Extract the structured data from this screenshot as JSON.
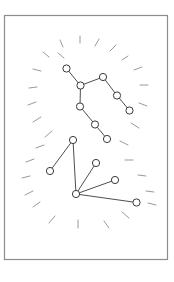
{
  "figure": {
    "canvas": {
      "width": 174,
      "height": 282,
      "background": "#ffffff"
    },
    "frame": {
      "x": 4.5,
      "y": 15.5,
      "width": 163,
      "height": 244,
      "stroke": "#8d8d8d",
      "stroke_width": 1.2,
      "fill": "#ffffff"
    },
    "style": {
      "node_fill": "#ffffff",
      "node_stroke": "#3a3a3a",
      "node_stroke_width": 1.0,
      "node_radius": 3.6,
      "edge_stroke": "#3a3a3a",
      "edge_stroke_width": 0.9,
      "ray_stroke": "#9a9a9a",
      "ray_stroke_width": 1.0
    },
    "constellations": [
      {
        "name": "upper-constellation",
        "label": "big-dipper-like",
        "nodes": [
          {
            "id": "u1",
            "cx": 66.5,
            "cy": 68.5
          },
          {
            "id": "u2",
            "cx": 80.5,
            "cy": 85.5
          },
          {
            "id": "u3",
            "cx": 103.0,
            "cy": 77.0
          },
          {
            "id": "u4",
            "cx": 117.0,
            "cy": 95.5
          },
          {
            "id": "u5",
            "cx": 129.5,
            "cy": 110.5
          },
          {
            "id": "u6",
            "cx": 80.0,
            "cy": 106.5
          },
          {
            "id": "u7",
            "cx": 95.0,
            "cy": 124.5
          },
          {
            "id": "u8",
            "cx": 107.0,
            "cy": 139.0
          }
        ],
        "edges": [
          [
            "u1",
            "u2"
          ],
          [
            "u2",
            "u3"
          ],
          [
            "u3",
            "u4"
          ],
          [
            "u4",
            "u5"
          ],
          [
            "u2",
            "u6"
          ],
          [
            "u6",
            "u7"
          ],
          [
            "u7",
            "u8"
          ]
        ]
      },
      {
        "name": "lower-constellation",
        "label": "fan-hub-like",
        "nodes": [
          {
            "id": "l1",
            "cx": 73.0,
            "cy": 140.0
          },
          {
            "id": "l2",
            "cx": 50.0,
            "cy": 171.0
          },
          {
            "id": "l3",
            "cx": 96.0,
            "cy": 163.0
          },
          {
            "id": "l4",
            "cx": 115.0,
            "cy": 180.0
          },
          {
            "id": "l5",
            "cx": 76.0,
            "cy": 194.0
          },
          {
            "id": "l6",
            "cx": 136.5,
            "cy": 202.5
          }
        ],
        "edges": [
          [
            "l1",
            "l2"
          ],
          [
            "l1",
            "l5"
          ],
          [
            "l5",
            "l3"
          ],
          [
            "l5",
            "l4"
          ],
          [
            "l5",
            "l6"
          ]
        ]
      }
    ],
    "rays": [
      {
        "x1": 63,
        "y1": 47,
        "x2": 60,
        "y2": 40
      },
      {
        "x1": 80,
        "y1": 43,
        "x2": 80,
        "y2": 36
      },
      {
        "x1": 95,
        "y1": 46,
        "x2": 99,
        "y2": 39
      },
      {
        "x1": 110,
        "y1": 51,
        "x2": 116,
        "y2": 45
      },
      {
        "x1": 49,
        "y1": 57,
        "x2": 43,
        "y2": 52
      },
      {
        "x1": 41,
        "y1": 71,
        "x2": 33,
        "y2": 69
      },
      {
        "x1": 122,
        "y1": 60,
        "x2": 128,
        "y2": 56
      },
      {
        "x1": 134,
        "y1": 70,
        "x2": 142,
        "y2": 67
      },
      {
        "x1": 140,
        "y1": 85,
        "x2": 148,
        "y2": 85
      },
      {
        "x1": 37,
        "y1": 87,
        "x2": 29,
        "y2": 88
      },
      {
        "x1": 36,
        "y1": 102,
        "x2": 28,
        "y2": 105
      },
      {
        "x1": 139,
        "y1": 103,
        "x2": 147,
        "y2": 106
      },
      {
        "x1": 41,
        "y1": 117,
        "x2": 33,
        "y2": 122
      },
      {
        "x1": 131,
        "y1": 123,
        "x2": 139,
        "y2": 128
      },
      {
        "x1": 52,
        "y1": 131,
        "x2": 45,
        "y2": 137
      },
      {
        "x1": 44,
        "y1": 145,
        "x2": 36,
        "y2": 148
      },
      {
        "x1": 120,
        "y1": 141,
        "x2": 128,
        "y2": 145
      },
      {
        "x1": 34,
        "y1": 159,
        "x2": 26,
        "y2": 162
      },
      {
        "x1": 125,
        "y1": 160,
        "x2": 133,
        "y2": 160
      },
      {
        "x1": 30,
        "y1": 176,
        "x2": 22,
        "y2": 178
      },
      {
        "x1": 138,
        "y1": 175,
        "x2": 146,
        "y2": 176
      },
      {
        "x1": 33,
        "y1": 191,
        "x2": 25,
        "y2": 195
      },
      {
        "x1": 146,
        "y1": 191,
        "x2": 154,
        "y2": 192
      },
      {
        "x1": 40,
        "y1": 202,
        "x2": 33,
        "y2": 207
      },
      {
        "x1": 148,
        "y1": 203,
        "x2": 156,
        "y2": 205
      },
      {
        "x1": 55,
        "y1": 216,
        "x2": 49,
        "y2": 223
      },
      {
        "x1": 78,
        "y1": 220,
        "x2": 78,
        "y2": 228
      },
      {
        "x1": 104,
        "y1": 221,
        "x2": 109,
        "y2": 228
      },
      {
        "x1": 122,
        "y1": 212,
        "x2": 129,
        "y2": 218
      },
      {
        "x1": 64,
        "y1": 58,
        "x2": 58,
        "y2": 53
      }
    ]
  }
}
